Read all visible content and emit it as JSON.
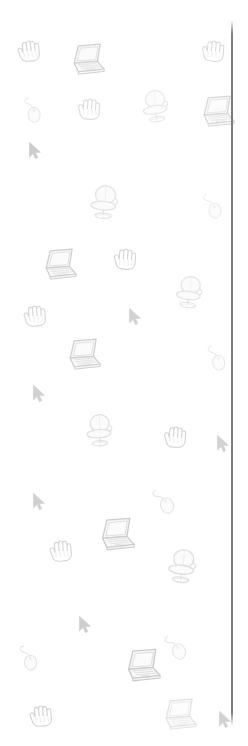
{
  "canvas": {
    "width": 248,
    "height": 746,
    "background_color": "#ffffff",
    "description": "Narrow vertical panel with scattered pale grayscale computing icons and a vertical divider line at the right edge"
  },
  "divider": {
    "name": "vertical-divider-line",
    "color": "#7d7d7d",
    "x": 231,
    "y": 20,
    "width": 2,
    "height": 706
  },
  "palette": {
    "ink_dark": "#9a9a9a",
    "ink_mid": "#bcbcbc",
    "ink_light": "#d8d8d8",
    "ink_faint": "#ececec",
    "screen_fill": "#fbfbfb",
    "body_fill": "#f2f2f2"
  },
  "icons": [
    {
      "kind": "hand-cursor-icon",
      "label": "Grab hand cursor",
      "x": 14,
      "y": 38,
      "size": 30,
      "rotate": -6,
      "opacity": 0.4
    },
    {
      "kind": "laptop-icon",
      "label": "Laptop computer",
      "x": 66,
      "y": 40,
      "size": 40,
      "rotate": 0,
      "opacity": 0.46
    },
    {
      "kind": "hand-cursor-icon",
      "label": "Grab hand cursor",
      "x": 198,
      "y": 38,
      "size": 30,
      "rotate": 5,
      "opacity": 0.34
    },
    {
      "kind": "mouse-icon",
      "label": "Computer mouse",
      "x": 16,
      "y": 92,
      "size": 34,
      "rotate": 0,
      "opacity": 0.22
    },
    {
      "kind": "hand-cursor-icon",
      "label": "Grab hand cursor",
      "x": 74,
      "y": 96,
      "size": 30,
      "rotate": 4,
      "opacity": 0.34
    },
    {
      "kind": "office-chair-icon",
      "label": "Office chair",
      "x": 136,
      "y": 86,
      "size": 40,
      "rotate": -8,
      "opacity": 0.22
    },
    {
      "kind": "laptop-icon",
      "label": "Laptop computer",
      "x": 196,
      "y": 92,
      "size": 40,
      "rotate": 0,
      "opacity": 0.4
    },
    {
      "kind": "arrow-cursor-icon",
      "label": "Arrow pointer cursor",
      "x": 24,
      "y": 139,
      "size": 24,
      "rotate": 0,
      "opacity": 0.5
    },
    {
      "kind": "office-chair-icon",
      "label": "Office chair",
      "x": 84,
      "y": 181,
      "size": 42,
      "rotate": 4,
      "opacity": 0.26
    },
    {
      "kind": "mouse-icon",
      "label": "Computer mouse",
      "x": 196,
      "y": 188,
      "size": 34,
      "rotate": -8,
      "opacity": 0.2
    },
    {
      "kind": "laptop-icon",
      "label": "Laptop computer",
      "x": 38,
      "y": 245,
      "size": 40,
      "rotate": 0,
      "opacity": 0.48
    },
    {
      "kind": "hand-cursor-icon",
      "label": "Grab hand cursor",
      "x": 110,
      "y": 246,
      "size": 30,
      "rotate": 4,
      "opacity": 0.4
    },
    {
      "kind": "office-chair-icon",
      "label": "Office chair",
      "x": 170,
      "y": 272,
      "size": 40,
      "rotate": 6,
      "opacity": 0.26
    },
    {
      "kind": "hand-cursor-icon",
      "label": "Grab hand cursor",
      "x": 20,
      "y": 303,
      "size": 30,
      "rotate": -4,
      "opacity": 0.4
    },
    {
      "kind": "arrow-cursor-icon",
      "label": "Arrow pointer cursor",
      "x": 124,
      "y": 305,
      "size": 24,
      "rotate": 0,
      "opacity": 0.44
    },
    {
      "kind": "laptop-icon",
      "label": "Laptop computer",
      "x": 62,
      "y": 335,
      "size": 40,
      "rotate": 0,
      "opacity": 0.48
    },
    {
      "kind": "mouse-icon",
      "label": "Computer mouse",
      "x": 200,
      "y": 340,
      "size": 34,
      "rotate": -6,
      "opacity": 0.22
    },
    {
      "kind": "arrow-cursor-icon",
      "label": "Arrow pointer cursor",
      "x": 28,
      "y": 382,
      "size": 24,
      "rotate": 0,
      "opacity": 0.46
    },
    {
      "kind": "office-chair-icon",
      "label": "Office chair",
      "x": 80,
      "y": 410,
      "size": 40,
      "rotate": -4,
      "opacity": 0.3
    },
    {
      "kind": "hand-cursor-icon",
      "label": "Grab hand cursor",
      "x": 160,
      "y": 424,
      "size": 30,
      "rotate": 4,
      "opacity": 0.4
    },
    {
      "kind": "arrow-cursor-icon",
      "label": "Arrow pointer cursor",
      "x": 212,
      "y": 432,
      "size": 24,
      "rotate": 0,
      "opacity": 0.44
    },
    {
      "kind": "arrow-cursor-icon",
      "label": "Arrow pointer cursor",
      "x": 28,
      "y": 490,
      "size": 24,
      "rotate": 0,
      "opacity": 0.46
    },
    {
      "kind": "mouse-icon",
      "label": "Computer mouse",
      "x": 146,
      "y": 482,
      "size": 36,
      "rotate": -18,
      "opacity": 0.26
    },
    {
      "kind": "hand-cursor-icon",
      "label": "Grab hand cursor",
      "x": 46,
      "y": 538,
      "size": 30,
      "rotate": -4,
      "opacity": 0.4
    },
    {
      "kind": "laptop-icon",
      "label": "Laptop computer",
      "x": 94,
      "y": 514,
      "size": 42,
      "rotate": 0,
      "opacity": 0.5
    },
    {
      "kind": "office-chair-icon",
      "label": "Office chair",
      "x": 162,
      "y": 545,
      "size": 42,
      "rotate": 6,
      "opacity": 0.3
    },
    {
      "kind": "arrow-cursor-icon",
      "label": "Arrow pointer cursor",
      "x": 74,
      "y": 613,
      "size": 24,
      "rotate": 0,
      "opacity": 0.48
    },
    {
      "kind": "mouse-icon",
      "label": "Computer mouse",
      "x": 158,
      "y": 628,
      "size": 36,
      "rotate": -18,
      "opacity": 0.24
    },
    {
      "kind": "mouse-icon",
      "label": "Computer mouse",
      "x": 12,
      "y": 640,
      "size": 34,
      "rotate": -4,
      "opacity": 0.26
    },
    {
      "kind": "laptop-icon",
      "label": "Laptop computer",
      "x": 120,
      "y": 645,
      "size": 42,
      "rotate": 0,
      "opacity": 0.52
    },
    {
      "kind": "hand-cursor-icon",
      "label": "Grab hand cursor",
      "x": 26,
      "y": 703,
      "size": 30,
      "rotate": -4,
      "opacity": 0.44
    },
    {
      "kind": "laptop-icon",
      "label": "Laptop computer",
      "x": 158,
      "y": 695,
      "size": 40,
      "rotate": 0,
      "opacity": 0.28
    },
    {
      "kind": "arrow-cursor-icon",
      "label": "Arrow pointer cursor",
      "x": 214,
      "y": 708,
      "size": 24,
      "rotate": 0,
      "opacity": 0.44
    }
  ]
}
